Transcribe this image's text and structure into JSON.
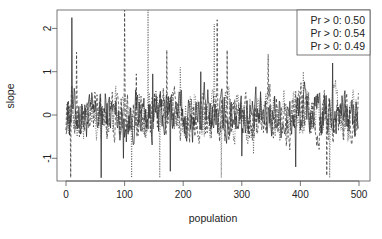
{
  "chart_data": {
    "type": "line",
    "title": "",
    "xlabel": "population",
    "ylabel": "slope",
    "xlim": [
      -10,
      515
    ],
    "ylim": [
      -1.45,
      2.45
    ],
    "xticks": [
      0,
      100,
      200,
      300,
      400,
      500
    ],
    "yticks": [
      -1,
      0,
      1,
      2
    ],
    "grid": false,
    "legend_position": "top-right",
    "legend": [
      "Pr > 0: 0.50",
      "Pr > 0: 0.54",
      "Pr > 0: 0.49"
    ],
    "series": [
      {
        "name": "Pr > 0: 0.50",
        "linestyle": "solid",
        "spikes": [
          [
            10,
            2.25
          ],
          [
            60,
            -1.45
          ],
          [
            98,
            -1.0
          ],
          [
            148,
            0.95
          ],
          [
            178,
            -1.3
          ],
          [
            230,
            1.0
          ],
          [
            300,
            -0.95
          ],
          [
            392,
            -1.2
          ],
          [
            455,
            1.2
          ]
        ]
      },
      {
        "name": "Pr > 0: 0.54",
        "linestyle": "dashed",
        "spikes": [
          [
            8,
            -1.45
          ],
          [
            18,
            1.45
          ],
          [
            100,
            2.45
          ],
          [
            120,
            0.95
          ],
          [
            172,
            1.5
          ],
          [
            258,
            2.2
          ],
          [
            275,
            1.5
          ],
          [
            345,
            1.4
          ],
          [
            445,
            -1.4
          ]
        ]
      },
      {
        "name": "Pr > 0: 0.49",
        "linestyle": "dotted",
        "spikes": [
          [
            112,
            -1.45
          ],
          [
            140,
            2.45
          ],
          [
            160,
            -1.45
          ],
          [
            195,
            1.1
          ],
          [
            253,
            2.1
          ],
          [
            265,
            -1.45
          ],
          [
            320,
            -0.9
          ],
          [
            405,
            1.0
          ],
          [
            450,
            -1.45
          ]
        ]
      }
    ],
    "n_points": 500
  }
}
